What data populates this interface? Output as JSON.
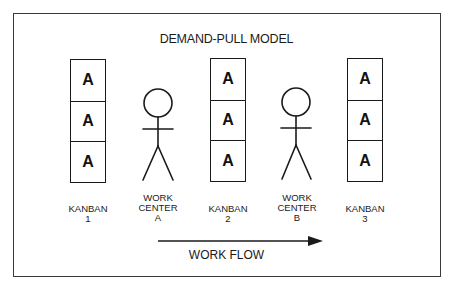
{
  "diagram": {
    "title": "DEMAND-PULL MODEL",
    "kanbans": [
      {
        "cards": [
          "A",
          "A",
          "A"
        ],
        "label": "KANBAN\n1"
      },
      {
        "cards": [
          "A",
          "A",
          "A"
        ],
        "label": "KANBAN\n2"
      },
      {
        "cards": [
          "A",
          "A",
          "A"
        ],
        "label": "KANBAN\n3"
      }
    ],
    "work_centers": [
      {
        "label": "WORK\nCENTER\nA",
        "icon": "stick-figure-icon"
      },
      {
        "label": "WORK\nCENTER\nB",
        "icon": "stick-figure-icon"
      }
    ],
    "flow": {
      "label": "WORK FLOW",
      "direction": "left-to-right",
      "icon": "arrow-right-icon"
    },
    "colors": {
      "ink": "#1a1a1a",
      "background": "#ffffff"
    }
  }
}
